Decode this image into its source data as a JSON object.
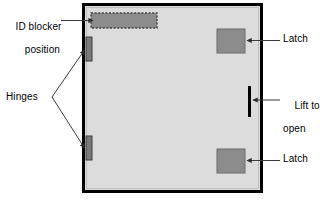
{
  "diagram": {
    "colors": {
      "frame_border": "#000000",
      "panel_fill": "#dcdcdc",
      "blocker_fill": "#8c8c8c",
      "blocker_border": "#4a4a4a",
      "latch_fill": "#8c8c8c",
      "latch_border": "#6b6b6b",
      "hinge_fill": "#7a7a7a",
      "hinge_border": "#3c3c3c",
      "lift_bar": "#000000",
      "leader_line": "#3b3b3b",
      "text": "#000000",
      "background": "#ffffff"
    },
    "labels": {
      "id_blocker_line1": "ID blocker",
      "id_blocker_line2": "position",
      "hinges": "Hinges",
      "latch_top": "Latch",
      "latch_bottom": "Latch",
      "lift_line1": "Lift to",
      "lift_line2": "open"
    },
    "parts": [
      {
        "name": "id-blocker",
        "shape": "dashed-rectangle",
        "label": "ID blocker position"
      },
      {
        "name": "hinge-upper",
        "shape": "vertical-bar",
        "label": "Hinges"
      },
      {
        "name": "hinge-lower",
        "shape": "vertical-bar",
        "label": "Hinges"
      },
      {
        "name": "latch-top",
        "shape": "square",
        "label": "Latch"
      },
      {
        "name": "latch-bottom",
        "shape": "square",
        "label": "Latch"
      },
      {
        "name": "lift-handle",
        "shape": "vertical-bar",
        "label": "Lift to open"
      }
    ]
  }
}
